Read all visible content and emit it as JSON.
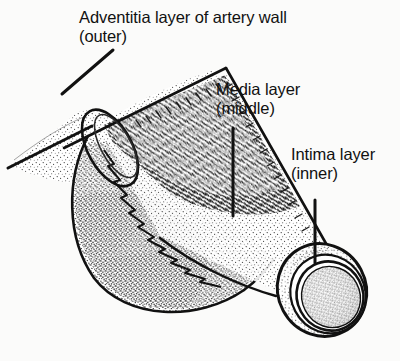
{
  "figure": {
    "style": "black-and-white stippled line drawing",
    "background_color": "#fbfbfa",
    "ink_color": "#111111"
  },
  "labels": {
    "adventitia": {
      "line1": "Adventitia layer of artery wall",
      "line2": "(outer)"
    },
    "media": {
      "line1": "Media layer",
      "line2": "(middle)"
    },
    "intima": {
      "line1": "Intima layer",
      "line2": "(inner)"
    }
  },
  "leaders": [
    {
      "name": "adventitia-leader",
      "from": [
        113,
        50
      ],
      "to": [
        62,
        94
      ]
    },
    {
      "name": "media-leader",
      "from": [
        233,
        128
      ],
      "to": [
        233,
        216
      ]
    },
    {
      "name": "intima-leader",
      "from": [
        315,
        200
      ],
      "to": [
        315,
        263
      ]
    }
  ],
  "anatomy": {
    "parts": [
      "adventitia-outer-layer",
      "media-middle-layer",
      "intima-inner-layer",
      "lumen",
      "branch-stub",
      "cut-end-opening"
    ]
  }
}
